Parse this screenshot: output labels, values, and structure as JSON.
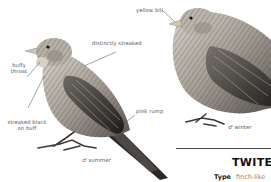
{
  "plate": {
    "species_title": "TWITE",
    "facts": [
      {
        "key": "Type",
        "value": "finch-like"
      }
    ]
  },
  "illustrations": [
    {
      "id": "summer-male",
      "caption": "♂ summer",
      "annotations": [
        {
          "label": "distinctly streaked"
        },
        {
          "label": "buffy throat"
        },
        {
          "label": "streaked black on buff"
        },
        {
          "label": "pink rump"
        }
      ]
    },
    {
      "id": "winter-male",
      "caption": "♂ winter",
      "annotations": [
        {
          "label": "yellow bill"
        }
      ]
    }
  ],
  "colors": {
    "ink": "#333333",
    "plumage_light": "#cfcac2",
    "plumage_mid": "#8d8880",
    "plumage_dark": "#2e2c2a",
    "background": "#ffffff"
  }
}
